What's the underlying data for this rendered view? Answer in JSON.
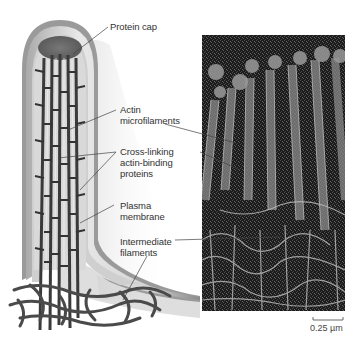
{
  "figure": {
    "drawing": {
      "description": "Illustration of a microvillus showing actin bundle, protein cap and terminal web"
    },
    "labels": [
      {
        "id": "protein-cap",
        "lines": [
          "Protein cap"
        ]
      },
      {
        "id": "actin-microfilaments",
        "lines": [
          "Actin",
          "microfilaments"
        ]
      },
      {
        "id": "cross-linking",
        "lines": [
          "Cross-linking",
          "actin-binding",
          "proteins"
        ]
      },
      {
        "id": "plasma-membrane",
        "lines": [
          "Plasma",
          "membrane"
        ]
      },
      {
        "id": "intermediate-filaments",
        "lines": [
          "Intermediate",
          "filaments"
        ]
      }
    ],
    "micrograph": {
      "description": "Electron micrograph of microvilli",
      "scale_bar": "0.25 µm"
    }
  }
}
